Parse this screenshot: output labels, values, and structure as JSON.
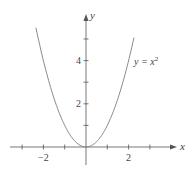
{
  "chart_data": {
    "type": "line",
    "title": "",
    "function_label": "y = x²",
    "function_label_base": "y = x",
    "function_label_exp": "2",
    "xlabel": "x",
    "ylabel": "y",
    "xlim": [
      -3.3,
      3.3
    ],
    "ylim": [
      -0.7,
      6
    ],
    "x_ticks": [
      -3,
      -2,
      -1,
      0,
      1,
      2,
      3
    ],
    "x_tick_labels": [
      {
        "value": -2,
        "label": "−2"
      },
      {
        "value": 2,
        "label": "2"
      }
    ],
    "y_ticks": [
      1,
      2,
      3,
      4,
      5
    ],
    "y_tick_labels": [
      {
        "value": 2,
        "label": "2"
      },
      {
        "value": 4,
        "label": "4"
      }
    ],
    "grid": false,
    "series": [
      {
        "name": "y = x^2",
        "x": [
          -2.35,
          -2,
          -1.5,
          -1,
          -0.5,
          0,
          0.5,
          1,
          1.5,
          2,
          2.25
        ],
        "y": [
          5.52,
          4,
          2.25,
          1,
          0.25,
          0,
          0.25,
          1,
          2.25,
          4,
          5.06
        ]
      }
    ]
  },
  "colors": {
    "curve": "#8a8a8a",
    "axis": "#555555",
    "text": "#444444"
  }
}
